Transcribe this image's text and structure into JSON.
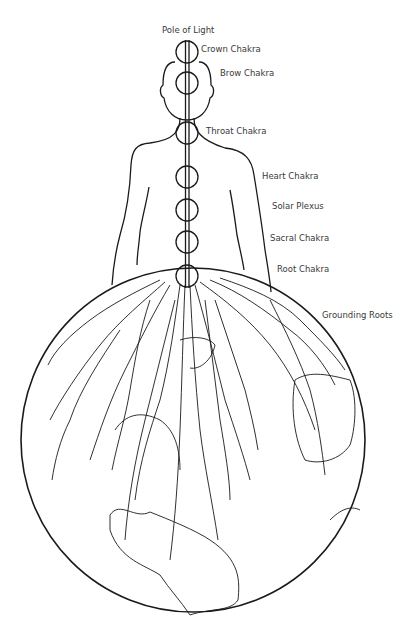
{
  "diagram": {
    "labels": {
      "pole": "Pole of Light",
      "crown": "Crown Chakra",
      "brow": "Brow Chakra",
      "throat": "Throat Chakra",
      "heart": "Heart Chakra",
      "solar": "Solar Plexus",
      "sacral": "Sacral Chakra",
      "root": "Root Chakra",
      "grounding": "Grounding Roots"
    },
    "colors": {
      "line": "#1a1a1a",
      "text": "#3a3a3a",
      "background": "#ffffff"
    }
  }
}
